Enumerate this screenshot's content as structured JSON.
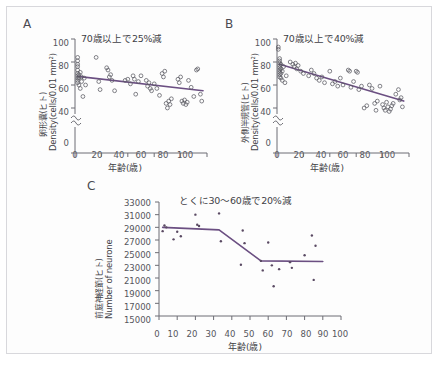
{
  "figure": {
    "background_color": "#fdfdfd",
    "border_color": "#d8d8dc",
    "trend_color": "#6b4f82",
    "axis_color": "#6d6d74",
    "marker_color": "#5a5a62"
  },
  "panels": {
    "a": {
      "letter": "A",
      "title": "70歳以上で25%減",
      "ylabel_jp": "卵形嚢(ヒト)",
      "ylabel_en": "Density(cells/0.01 mm²)",
      "xlabel": "年齢(歳)",
      "yticks": [
        "100",
        "80",
        "60",
        "40",
        "0"
      ],
      "xticks": [
        "0",
        "20",
        "40",
        "60",
        "80",
        "100"
      ]
    },
    "b": {
      "letter": "B",
      "title": "70歳以上で40%減",
      "ylabel_jp": "外側半規管(ヒト)",
      "ylabel_en": "Density(cells/0.01 mm²)",
      "xlabel": "年齢(歳)",
      "yticks": [
        "100",
        "80",
        "60",
        "40",
        "0"
      ],
      "xticks": [
        "0",
        "20",
        "40",
        "60",
        "80",
        "100"
      ]
    },
    "c": {
      "letter": "C",
      "title": "とくに30〜60歳で20%減",
      "ylabel_jp": "前庭神経節(ヒト)",
      "ylabel_en": "Number of neurone",
      "xlabel": "年齢(歳)",
      "yticks": [
        "33000",
        "31000",
        "29000",
        "27000",
        "25000",
        "23000",
        "21000",
        "19000",
        "17000",
        "15000"
      ],
      "xticks": [
        "0",
        "10",
        "20",
        "30",
        "40",
        "50",
        "60",
        "70",
        "80",
        "90",
        "100"
      ]
    }
  },
  "chart_data": [
    {
      "id": "panel-a",
      "type": "scatter",
      "title": "70歳以上で25%減",
      "xlabel": "年齢(歳)",
      "ylabel": "卵形嚢(ヒト) Density(cells/0.01 mm²)",
      "xlim": [
        0,
        100
      ],
      "ylim": [
        30,
        100
      ],
      "axis_break": true,
      "grid": false,
      "legend": "none",
      "points": [
        [
          2,
          84
        ],
        [
          2,
          81
        ],
        [
          2,
          78
        ],
        [
          2,
          76
        ],
        [
          2,
          73
        ],
        [
          2,
          70
        ],
        [
          2,
          68
        ],
        [
          2,
          66
        ],
        [
          2,
          64
        ],
        [
          2,
          62
        ],
        [
          3,
          69
        ],
        [
          3,
          66
        ],
        [
          3,
          60
        ],
        [
          4,
          71
        ],
        [
          4,
          57
        ],
        [
          5,
          67
        ],
        [
          5,
          63
        ],
        [
          6,
          50
        ],
        [
          7,
          66
        ],
        [
          8,
          60
        ],
        [
          16,
          84
        ],
        [
          18,
          63
        ],
        [
          19,
          56
        ],
        [
          24,
          75
        ],
        [
          25,
          73
        ],
        [
          26,
          67
        ],
        [
          27,
          69
        ],
        [
          28,
          64
        ],
        [
          30,
          55
        ],
        [
          38,
          64
        ],
        [
          40,
          65
        ],
        [
          42,
          61
        ],
        [
          44,
          68
        ],
        [
          45,
          65
        ],
        [
          46,
          52
        ],
        [
          48,
          63
        ],
        [
          50,
          68
        ],
        [
          54,
          64
        ],
        [
          55,
          59
        ],
        [
          56,
          62
        ],
        [
          57,
          57
        ],
        [
          58,
          55
        ],
        [
          60,
          61
        ],
        [
          62,
          57
        ],
        [
          64,
          51
        ],
        [
          66,
          70
        ],
        [
          67,
          67
        ],
        [
          68,
          72
        ],
        [
          69,
          44
        ],
        [
          70,
          40
        ],
        [
          71,
          46
        ],
        [
          72,
          43
        ],
        [
          73,
          48
        ],
        [
          78,
          65
        ],
        [
          79,
          62
        ],
        [
          80,
          67
        ],
        [
          81,
          46
        ],
        [
          82,
          44
        ],
        [
          83,
          47
        ],
        [
          84,
          43
        ],
        [
          85,
          45
        ],
        [
          86,
          64
        ],
        [
          88,
          58
        ],
        [
          90,
          50
        ],
        [
          92,
          73
        ],
        [
          93,
          74
        ],
        [
          95,
          52
        ],
        [
          96,
          46
        ]
      ],
      "trend_line": {
        "x": [
          2,
          97
        ],
        "y": [
          67.5,
          55
        ]
      }
    },
    {
      "id": "panel-b",
      "type": "scatter",
      "title": "70歳以上で40%減",
      "xlabel": "年齢(歳)",
      "ylabel": "外側半規管(ヒト) Density(cells/0.01 mm²)",
      "xlim": [
        0,
        100
      ],
      "ylim": [
        30,
        100
      ],
      "axis_break": true,
      "grid": false,
      "legend": "none",
      "points": [
        [
          1,
          93
        ],
        [
          1,
          91
        ],
        [
          2,
          83
        ],
        [
          2,
          81
        ],
        [
          2,
          79
        ],
        [
          2,
          77
        ],
        [
          2,
          75
        ],
        [
          2,
          73
        ],
        [
          2,
          71
        ],
        [
          2,
          69
        ],
        [
          2,
          67
        ],
        [
          3,
          78
        ],
        [
          3,
          74
        ],
        [
          3,
          70
        ],
        [
          3,
          66
        ],
        [
          4,
          72
        ],
        [
          4,
          64
        ],
        [
          5,
          76
        ],
        [
          6,
          62
        ],
        [
          7,
          68
        ],
        [
          10,
          80
        ],
        [
          12,
          78
        ],
        [
          13,
          76
        ],
        [
          14,
          79
        ],
        [
          15,
          74
        ],
        [
          16,
          77
        ],
        [
          18,
          72
        ],
        [
          20,
          70
        ],
        [
          24,
          68
        ],
        [
          26,
          73
        ],
        [
          28,
          70
        ],
        [
          30,
          66
        ],
        [
          32,
          64
        ],
        [
          34,
          67
        ],
        [
          36,
          62
        ],
        [
          40,
          72
        ],
        [
          42,
          61
        ],
        [
          44,
          63
        ],
        [
          46,
          59
        ],
        [
          48,
          66
        ],
        [
          50,
          60
        ],
        [
          54,
          73
        ],
        [
          55,
          72
        ],
        [
          56,
          58
        ],
        [
          58,
          63
        ],
        [
          60,
          72
        ],
        [
          61,
          71
        ],
        [
          62,
          56
        ],
        [
          64,
          59
        ],
        [
          66,
          40
        ],
        [
          68,
          42
        ],
        [
          70,
          60
        ],
        [
          72,
          57
        ],
        [
          74,
          44
        ],
        [
          75,
          38
        ],
        [
          76,
          46
        ],
        [
          78,
          59
        ],
        [
          80,
          43
        ],
        [
          81,
          40
        ],
        [
          82,
          38
        ],
        [
          83,
          45
        ],
        [
          84,
          41
        ],
        [
          85,
          37
        ],
        [
          86,
          39
        ],
        [
          87,
          42
        ],
        [
          88,
          44
        ],
        [
          90,
          52
        ],
        [
          92,
          56
        ],
        [
          93,
          47
        ],
        [
          94,
          49
        ],
        [
          95,
          41
        ]
      ],
      "trend_line": {
        "x": [
          2,
          96
        ],
        "y": [
          78,
          46
        ]
      }
    },
    {
      "id": "panel-c",
      "type": "scatter",
      "title": "とくに30〜60歳で20%減",
      "xlabel": "年齢(歳)",
      "ylabel": "前庭神経節(ヒト) Number of neurone",
      "xlim": [
        0,
        100
      ],
      "ylim": [
        15000,
        33000
      ],
      "grid": false,
      "legend": "none",
      "points": [
        [
          2,
          28400
        ],
        [
          3,
          29300
        ],
        [
          4,
          29000
        ],
        [
          8,
          27100
        ],
        [
          10,
          28300
        ],
        [
          12,
          27600
        ],
        [
          20,
          31000
        ],
        [
          21,
          29400
        ],
        [
          22,
          29200
        ],
        [
          33,
          31200
        ],
        [
          34,
          26800
        ],
        [
          45,
          23100
        ],
        [
          46,
          28500
        ],
        [
          47,
          26500
        ],
        [
          56,
          23700
        ],
        [
          57,
          22200
        ],
        [
          60,
          26600
        ],
        [
          62,
          23000
        ],
        [
          63,
          19700
        ],
        [
          66,
          22400
        ],
        [
          72,
          23500
        ],
        [
          73,
          22600
        ],
        [
          80,
          24600
        ],
        [
          84,
          27700
        ],
        [
          85,
          20700
        ],
        [
          86,
          26100
        ]
      ],
      "trend_line": {
        "x": [
          2,
          33,
          56,
          90
        ],
        "y": [
          29000,
          28600,
          23700,
          23600
        ]
      }
    }
  ]
}
